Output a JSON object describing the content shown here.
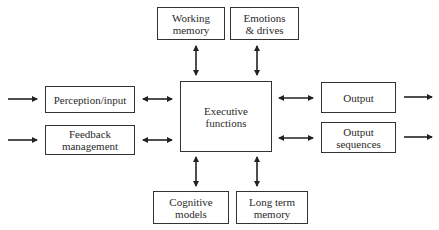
{
  "diagram": {
    "center": {
      "id": "executive",
      "label": [
        "Executive",
        "functions"
      ]
    },
    "top": [
      {
        "id": "working-memory",
        "label": [
          "Working",
          "memory"
        ]
      },
      {
        "id": "emotions-drives",
        "label": [
          "Emotions",
          "& drives"
        ]
      }
    ],
    "bottom": [
      {
        "id": "cognitive-models",
        "label": [
          "Cognitive",
          "models"
        ]
      },
      {
        "id": "long-term-memory",
        "label": [
          "Long term",
          "memory"
        ]
      }
    ],
    "left": [
      {
        "id": "perception-input",
        "label": [
          "Perception/input"
        ]
      },
      {
        "id": "feedback-management",
        "label": [
          "Feedback",
          "management"
        ]
      }
    ],
    "right": [
      {
        "id": "output",
        "label": [
          "Output"
        ]
      },
      {
        "id": "output-sequences",
        "label": [
          "Output",
          "sequences"
        ]
      }
    ],
    "connections": [
      {
        "from": "input",
        "to": "perception-input",
        "type": "one-way"
      },
      {
        "from": "input",
        "to": "feedback-management",
        "type": "one-way"
      },
      {
        "from": "perception-input",
        "to": "executive",
        "type": "two-way"
      },
      {
        "from": "feedback-management",
        "to": "executive",
        "type": "two-way"
      },
      {
        "from": "working-memory",
        "to": "executive",
        "type": "two-way"
      },
      {
        "from": "emotions-drives",
        "to": "executive",
        "type": "two-way"
      },
      {
        "from": "cognitive-models",
        "to": "executive",
        "type": "two-way"
      },
      {
        "from": "long-term-memory",
        "to": "executive",
        "type": "two-way"
      },
      {
        "from": "executive",
        "to": "output",
        "type": "two-way"
      },
      {
        "from": "executive",
        "to": "output-sequences",
        "type": "two-way"
      },
      {
        "from": "output",
        "to": "external",
        "type": "one-way"
      },
      {
        "from": "output-sequences",
        "to": "external",
        "type": "one-way"
      }
    ]
  }
}
